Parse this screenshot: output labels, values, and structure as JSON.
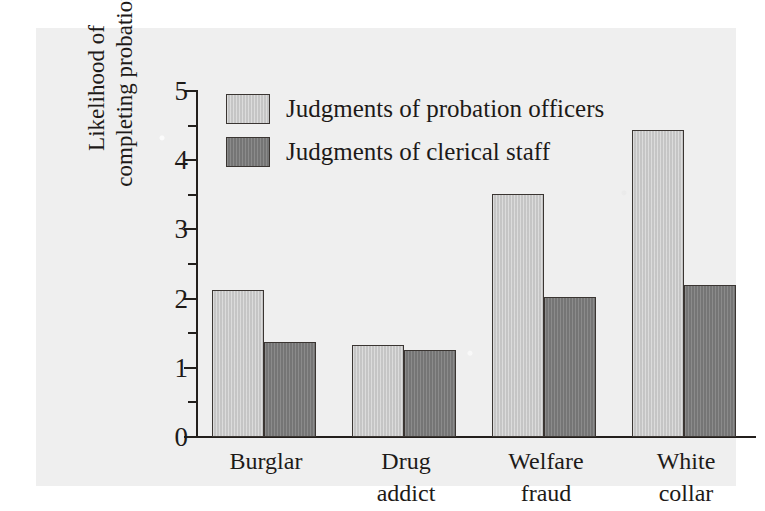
{
  "chart_data": {
    "type": "bar",
    "title": "",
    "subtitle": "",
    "xlabel": "",
    "ylabel_line1": "Likelihood of",
    "ylabel_line2": "completing probation",
    "categories": [
      "Burglar",
      "Drug addict",
      "Welfare fraud",
      "White collar"
    ],
    "category_lines": [
      [
        "Burglar",
        ""
      ],
      [
        "Drug",
        "addict"
      ],
      [
        "Welfare",
        "fraud"
      ],
      [
        "White",
        "collar"
      ]
    ],
    "series": [
      {
        "name": "Judgments of probation officers",
        "color": "#c9c9c9",
        "values": [
          2.12,
          1.33,
          3.51,
          4.44
        ]
      },
      {
        "name": "Judgments of clerical staff",
        "color": "#7b7b7b",
        "values": [
          1.37,
          1.26,
          2.02,
          2.2
        ]
      }
    ],
    "ylim": [
      0,
      5
    ],
    "ytick_labels": [
      "0",
      "1",
      "2",
      "3",
      "4",
      "5"
    ],
    "ytick_values": [
      0,
      1,
      2,
      3,
      4,
      5
    ],
    "yminor_values": [
      0.5,
      1.5,
      2.5,
      3.5,
      4.5
    ],
    "grid": false,
    "legend_position": "top-left",
    "legend": [
      "Judgments of probation officers",
      "Judgments of clerical staff"
    ]
  },
  "colors": {
    "series_light": "#c9c9c9",
    "series_dark": "#7b7b7b",
    "axis": "#231f1c",
    "text": "#1d1a18",
    "panel_background": "#efefef",
    "page_background": "#ffffff"
  }
}
